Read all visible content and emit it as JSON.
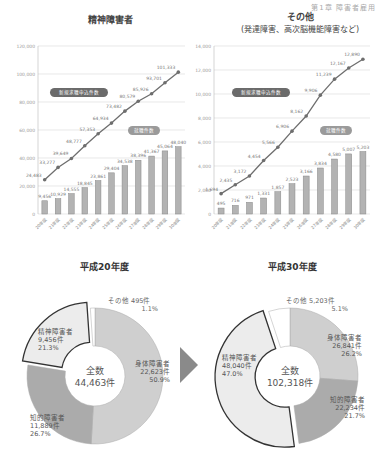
{
  "header": {
    "text": "第1章 障害者雇用"
  },
  "chart_data": [
    {
      "type": "bar+line",
      "title": "精神障害者",
      "categories": [
        "20年度",
        "21年度",
        "22年度",
        "23年度",
        "24年度",
        "25年度",
        "26年度",
        "27年度",
        "28年度",
        "29年度",
        "30年度"
      ],
      "ylim": [
        0,
        120000
      ],
      "yticks": [
        "0",
        "20,000",
        "40,000",
        "60,000",
        "80,000",
        "100,000",
        "120,000"
      ],
      "series": [
        {
          "name": "新規求職申込件数",
          "type": "line",
          "values": [
            24483,
            33277,
            39649,
            48777,
            57353,
            64934,
            73482,
            80579,
            85926,
            93701,
            101333
          ],
          "labels": [
            "24,483",
            "33,277",
            "39,649",
            "48,777",
            "57,353",
            "64,934",
            "73,482",
            "80,579",
            "85,926",
            "93,701",
            "101,333"
          ]
        },
        {
          "name": "就職件数",
          "type": "bar",
          "values": [
            9456,
            10929,
            14555,
            18845,
            23861,
            29404,
            34538,
            38396,
            41367,
            45064,
            48040
          ],
          "labels": [
            "9,456",
            "10,929",
            "14,555",
            "18,845",
            "23,861",
            "29,404",
            "34,538",
            "38,396",
            "41,367",
            "45,064",
            "48,040"
          ]
        }
      ],
      "grid": true
    },
    {
      "type": "bar+line",
      "title": "その他",
      "subtitle": "(発達障害、高次脳機能障害など)",
      "categories": [
        "20年度",
        "21年度",
        "22年度",
        "23年度",
        "24年度",
        "25年度",
        "26年度",
        "27年度",
        "28年度",
        "29年度",
        "30年度"
      ],
      "ylim": [
        0,
        14000
      ],
      "yticks": [
        "0",
        "2,000",
        "4,000",
        "6,000",
        "8,000",
        "10,000",
        "12,000",
        "14,000"
      ],
      "series": [
        {
          "name": "新規求職申込件数",
          "type": "line",
          "values": [
            1694,
            2435,
            3172,
            4454,
            5566,
            6906,
            8162,
            9906,
            11239,
            12167,
            12890
          ],
          "labels": [
            "1,694",
            "2,435",
            "3,172",
            "4,454",
            "5,566",
            "6,906",
            "8,162",
            "9,906",
            "11,239",
            "12,167",
            "12,890"
          ]
        },
        {
          "name": "就職件数",
          "type": "bar",
          "values": [
            495,
            716,
            971,
            1331,
            1857,
            2523,
            3166,
            3834,
            4580,
            5007,
            5203
          ],
          "labels": [
            "495",
            "716",
            "971",
            "1,331",
            "1,857",
            "2,523",
            "3,166",
            "3,834",
            "4,580",
            "5,007",
            "5,203"
          ]
        }
      ],
      "grid": true
    },
    {
      "type": "pie",
      "title": "平成20年度",
      "center_label": "全数",
      "center_value": "44,463件",
      "slices": [
        {
          "name": "身体障害者",
          "count": "22,623件",
          "pct": "50.9%",
          "value": 50.9
        },
        {
          "name": "知的障害者",
          "count": "11,889件",
          "pct": "26.7%",
          "value": 26.7
        },
        {
          "name": "精神障害者",
          "count": "9,456件",
          "pct": "21.3%",
          "value": 21.3
        },
        {
          "name": "その他",
          "count": "495件",
          "pct": "1.1%",
          "value": 1.1
        }
      ]
    },
    {
      "type": "pie",
      "title": "平成30年度",
      "center_label": "全数",
      "center_value": "102,318件",
      "slices": [
        {
          "name": "身体障害者",
          "count": "26,841件",
          "pct": "26.2%",
          "value": 26.2
        },
        {
          "name": "知的障害者",
          "count": "22,234件",
          "pct": "21.7%",
          "value": 21.7
        },
        {
          "name": "精神障害者",
          "count": "48,040件",
          "pct": "47.0%",
          "value": 47.0
        },
        {
          "name": "その他",
          "count": "5,203件",
          "pct": "5.1%",
          "value": 5.1
        }
      ]
    }
  ],
  "colors": {
    "bar": "#b3b3b3",
    "bar_stroke": "#888888",
    "line": "#6e6e6e",
    "pill_bg": "#6b6b6b",
    "pill_light": "#9a9a9a",
    "grid": "#d8d8d8",
    "body_slice": "#cfcfcf",
    "intel_slice": "#ababab",
    "mental_slice": "#ececec",
    "other_slice": "#ffffff",
    "arrow": "#8a8a8a"
  }
}
